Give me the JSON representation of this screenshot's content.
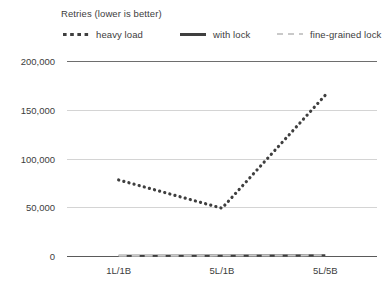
{
  "chart_data": {
    "type": "line",
    "title": "Retries (lower is better)",
    "xlabel": "",
    "ylabel": "",
    "categories": [
      "1L/1B",
      "5L/1B",
      "5L/5B"
    ],
    "series": [
      {
        "name": "heavy load",
        "values": [
          78000,
          49000,
          165000
        ],
        "style": "dotted",
        "color": "#3f3f3f"
      },
      {
        "name": "with lock",
        "values": [
          300,
          500,
          900
        ],
        "style": "solid",
        "color": "#3f3f3f"
      },
      {
        "name": "fine-grained lock",
        "values": [
          200,
          400,
          700
        ],
        "style": "dashed",
        "color": "#c9c9c9"
      }
    ],
    "ylim": [
      0,
      200000
    ],
    "yticks": [
      0,
      50000,
      100000,
      150000,
      200000
    ],
    "ytick_labels": [
      "0",
      "50,000",
      "100,000",
      "150,000",
      "200,000"
    ],
    "grid": true,
    "legend_position": "top"
  },
  "legend": {
    "title": "Retries (lower is better)",
    "items": [
      {
        "label": "heavy load",
        "swatch": "dotted-line-swatch"
      },
      {
        "label": "with lock",
        "swatch": "solid-line-swatch"
      },
      {
        "label": "fine-grained lock",
        "swatch": "dashed-line-swatch"
      }
    ]
  }
}
